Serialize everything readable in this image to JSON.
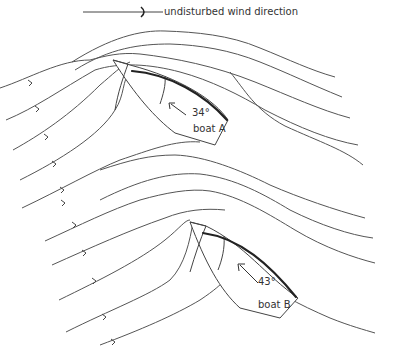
{
  "legend": {
    "label": "undisturbed wind direction",
    "icon": "arrow-right-icon"
  },
  "boats": [
    {
      "name": "boat A",
      "angle_label": "34°"
    },
    {
      "name": "boat B",
      "angle_label": "43°"
    }
  ],
  "colors": {
    "line": "#555555",
    "sail": "#222222",
    "background": "#ffffff"
  }
}
